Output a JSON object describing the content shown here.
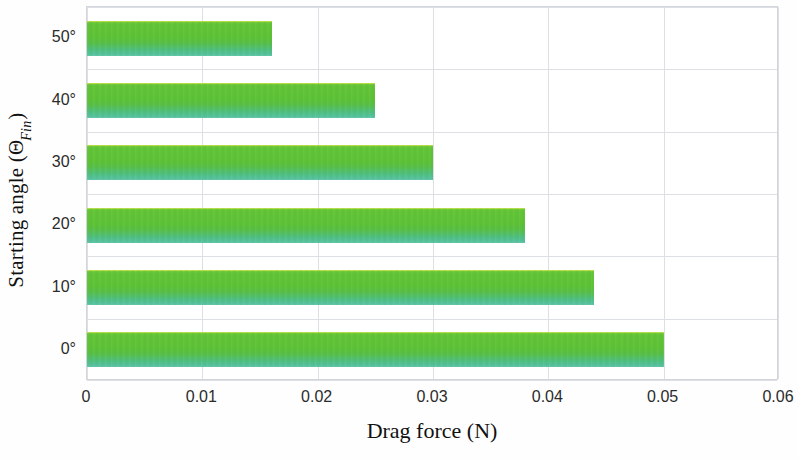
{
  "chart_data": {
    "type": "bar",
    "orientation": "horizontal",
    "title": "",
    "xlabel": "Drag force (N)",
    "ylabel_parts": {
      "prefix": "Starting angle (",
      "symbol": "Θ",
      "subscript": "Fin",
      "suffix": ")"
    },
    "ylabel": "Starting angle (ΘFin)",
    "categories": [
      "50°",
      "40°",
      "30°",
      "20°",
      "10°",
      "0°"
    ],
    "values": [
      0.016,
      0.025,
      0.03,
      0.038,
      0.044,
      0.05
    ],
    "xlim": [
      0,
      0.06
    ],
    "ylim": [
      0,
      6
    ],
    "xticks": [
      "0",
      "0.01",
      "0.02",
      "0.03",
      "0.04",
      "0.05",
      "0.06"
    ],
    "xtick_values": [
      0,
      0.01,
      0.02,
      0.03,
      0.04,
      0.05,
      0.06
    ],
    "grid": true,
    "grid_axis": "both",
    "legend": false,
    "legend_position": "none",
    "bar_color_top": "#5DC236",
    "bar_color_bottom": "#63C6A7",
    "grid_color": "#DCDFE3",
    "axis_color": "#D2D5D9",
    "background": "#FFFFFF"
  }
}
